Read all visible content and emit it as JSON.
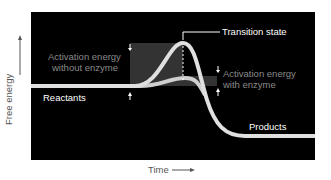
{
  "diagram": {
    "axes": {
      "y_label": "Free energy",
      "x_label": "Time"
    },
    "labels": {
      "transition_state": "Transition state",
      "activation_without_1": "Activation energy",
      "activation_without_2": "without enzyme",
      "activation_with_1": "Activation energy",
      "activation_with_2": "with enzyme",
      "reactants": "Reactants",
      "products": "Products"
    },
    "colors": {
      "background": "#000000",
      "curve": "#d8d8d8",
      "shade": "#3a3a3a",
      "muted_text": "#8a8a8a"
    }
  }
}
